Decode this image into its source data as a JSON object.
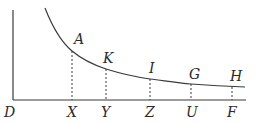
{
  "diagram": {
    "type": "hyperbola-area-diagram",
    "axes": {
      "origin_label": "D",
      "vertical": {
        "x": 13,
        "y_top": 10,
        "y_bottom": 100
      },
      "horizontal": {
        "y": 100,
        "x_left": 13,
        "x_right": 246
      }
    },
    "curve_path": "M 45 8 C 56 36, 66 46, 72 51 C 84 61, 94 65, 106 69 C 122 74, 136 77, 150 79 C 166 81, 178 83, 191 84 C 205 85, 220 86, 245 87",
    "points": [
      {
        "curve_label": "A",
        "base_label": "X",
        "x": 72,
        "y": 51,
        "label_x": 74,
        "label_y": 44
      },
      {
        "curve_label": "K",
        "base_label": "Y",
        "x": 106,
        "y": 69,
        "label_x": 103,
        "label_y": 63
      },
      {
        "curve_label": "I",
        "base_label": "Z",
        "x": 150,
        "y": 79,
        "label_x": 149,
        "label_y": 73
      },
      {
        "curve_label": "G",
        "base_label": "U",
        "x": 191,
        "y": 84,
        "label_x": 189,
        "label_y": 79
      },
      {
        "curve_label": "H",
        "base_label": "F",
        "x": 232,
        "y": 87,
        "label_x": 230,
        "label_y": 81
      }
    ],
    "colors": {
      "line": "#3a3a3a",
      "text": "#2a2a2a",
      "background": "#ffffff"
    }
  }
}
